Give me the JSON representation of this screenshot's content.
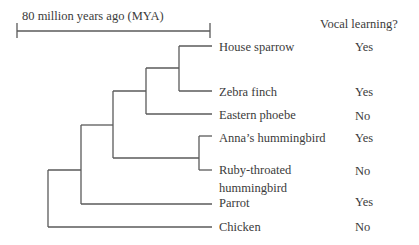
{
  "scale_bar": {
    "label": "80 million years ago (MYA)"
  },
  "column_header": "Vocal learning?",
  "species": [
    {
      "name": "House sparrow",
      "vocal_learning": "Yes"
    },
    {
      "name": "Zebra finch",
      "vocal_learning": "Yes"
    },
    {
      "name": "Eastern phoebe",
      "vocal_learning": "No"
    },
    {
      "name": "Anna’s hummingbird",
      "vocal_learning": "Yes"
    },
    {
      "name_line1": "Ruby-throated",
      "name_line2": "hummingbird",
      "vocal_learning": "No"
    },
    {
      "name": "Parrot",
      "vocal_learning": "Yes"
    },
    {
      "name": "Chicken",
      "vocal_learning": "No"
    }
  ],
  "colors": {
    "lines": "#555555",
    "text": "#3b3b3b"
  }
}
